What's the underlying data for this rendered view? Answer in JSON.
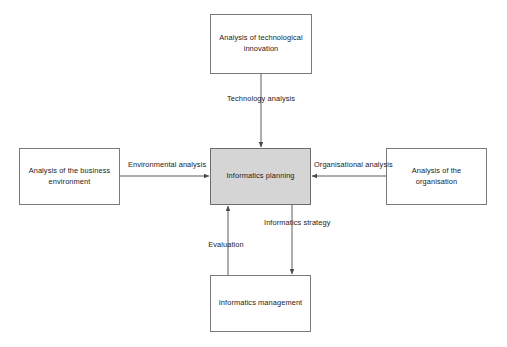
{
  "diagram": {
    "colors": {
      "central_fill": "#d5d5d5",
      "node_fill": "#ffffff",
      "stroke": "#7a7a7a",
      "text": "#1b1b1b"
    },
    "nodes": [
      {
        "id": "technological-innovation",
        "label": "Analysis of technological innovation",
        "x": 210,
        "y": 14,
        "w": 102,
        "h": 60,
        "central": false
      },
      {
        "id": "business-environment",
        "label": "Analysis of the business environment",
        "x": 19,
        "y": 148,
        "w": 101,
        "h": 57,
        "central": false
      },
      {
        "id": "informatics-planning",
        "label": "Informatics planning",
        "x": 210,
        "y": 148,
        "w": 101,
        "h": 57,
        "central": true
      },
      {
        "id": "organisation",
        "label": "Analysis of the organisation",
        "x": 386,
        "y": 148,
        "w": 101,
        "h": 57,
        "central": false
      },
      {
        "id": "informatics-management",
        "label": "Informatics management",
        "x": 210,
        "y": 275,
        "w": 101,
        "h": 57,
        "central": false
      }
    ],
    "edges": [
      {
        "id": "technology-analysis",
        "label": "Technology analysis",
        "from": "technological-innovation",
        "to": "informatics-planning",
        "direction": "down",
        "label_x": 260,
        "label_y": 96,
        "label_align": "center"
      },
      {
        "id": "environmental-analysis",
        "label": "Environmental analysis",
        "from": "business-environment",
        "to": "informatics-planning",
        "direction": "right",
        "label_x": 165,
        "label_y": 163,
        "label_align": "center"
      },
      {
        "id": "organisational-analysis",
        "label": "Organisational analysis",
        "from": "organisation",
        "to": "informatics-planning",
        "direction": "left",
        "label_x": 348,
        "label_y": 163,
        "label_align": "center"
      },
      {
        "id": "informatics-strategy",
        "label": "Informatics strategy",
        "from": "informatics-planning",
        "to": "informatics-management",
        "direction": "down",
        "label_x": 290,
        "label_y": 220,
        "label_align": "center"
      },
      {
        "id": "evaluation",
        "label": "Evaluation",
        "from": "informatics-management",
        "to": "informatics-planning",
        "direction": "up",
        "label_x": 224,
        "label_y": 240,
        "label_align": "center"
      }
    ]
  }
}
